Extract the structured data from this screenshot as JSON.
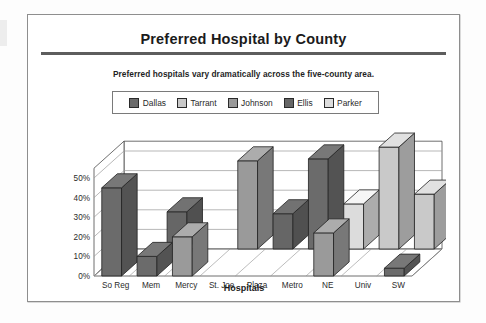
{
  "document": {
    "title": "Preferred Hospital by County",
    "subtitle": "Preferred hospitals vary dramatically across the five-county area."
  },
  "legend": {
    "position": "top-center",
    "items": [
      {
        "label": "Dallas",
        "color": "#6b6b6b"
      },
      {
        "label": "Tarrant",
        "color": "#c9c9c9"
      },
      {
        "label": "Johnson",
        "color": "#9a9a9a"
      },
      {
        "label": "Ellis",
        "color": "#666666"
      },
      {
        "label": "Parker",
        "color": "#dcdcdc"
      }
    ]
  },
  "chart_data": {
    "type": "bar",
    "title": "Preferred Hospital by County",
    "subtitle": "Preferred hospitals vary dramatically across the five-county area.",
    "xlabel": "Hospitals",
    "ylabel": "",
    "ylim": [
      0,
      55
    ],
    "yticks": [
      "0%",
      "10%",
      "20%",
      "30%",
      "40%",
      "50%"
    ],
    "ytick_values": [
      0,
      10,
      20,
      30,
      40,
      50
    ],
    "grid": true,
    "three_d": true,
    "categories": [
      "So Reg",
      "Mem",
      "Mercy",
      "St. Joe",
      "Plaza",
      "Metro",
      "NE",
      "Univ",
      "SW"
    ],
    "series": [
      {
        "name": "Dallas",
        "color": "#6b6b6b",
        "values": [
          45,
          10,
          0,
          0,
          0,
          46,
          0,
          0,
          4
        ]
      },
      {
        "name": "Tarrant",
        "color": "#c9c9c9",
        "values": [
          0,
          0,
          0,
          0,
          0,
          0,
          0,
          52,
          28
        ]
      },
      {
        "name": "Johnson",
        "color": "#9a9a9a",
        "values": [
          0,
          0,
          20,
          45,
          0,
          0,
          22,
          0,
          0
        ]
      },
      {
        "name": "Ellis",
        "color": "#666666",
        "values": [
          0,
          19,
          0,
          0,
          18,
          0,
          0,
          0,
          0
        ]
      },
      {
        "name": "Parker",
        "color": "#dcdcdc",
        "values": [
          0,
          0,
          0,
          0,
          0,
          0,
          23,
          0,
          0
        ]
      }
    ],
    "bars": [
      {
        "category": "So Reg",
        "series": "Dallas",
        "value": 45,
        "depth_row": 0
      },
      {
        "category": "Mem",
        "series": "Ellis",
        "value": 19,
        "depth_row": 1
      },
      {
        "category": "Mem",
        "series": "Dallas",
        "value": 10,
        "depth_row": 0
      },
      {
        "category": "Mercy",
        "series": "Johnson",
        "value": 20,
        "depth_row": 0
      },
      {
        "category": "St. Joe",
        "series": "Johnson",
        "value": 45,
        "depth_row": 1
      },
      {
        "category": "Plaza",
        "series": "Ellis",
        "value": 18,
        "depth_row": 1
      },
      {
        "category": "Metro",
        "series": "Dallas",
        "value": 46,
        "depth_row": 1
      },
      {
        "category": "NE",
        "series": "Parker",
        "value": 23,
        "depth_row": 1
      },
      {
        "category": "NE",
        "series": "Johnson",
        "value": 22,
        "depth_row": 0
      },
      {
        "category": "Univ",
        "series": "Tarrant",
        "value": 52,
        "depth_row": 1
      },
      {
        "category": "SW",
        "series": "Tarrant",
        "value": 28,
        "depth_row": 1
      },
      {
        "category": "SW",
        "series": "Dallas",
        "value": 4,
        "depth_row": 0
      }
    ]
  },
  "axes": {
    "y_ticks": [
      "50%",
      "40%",
      "30%",
      "20%",
      "10%",
      "0%"
    ],
    "x_labels": [
      "So Reg",
      "Mem",
      "Mercy",
      "St. Joe",
      "Plaza",
      "Metro",
      "NE",
      "Univ",
      "SW"
    ],
    "x_title": "Hospitals"
  }
}
